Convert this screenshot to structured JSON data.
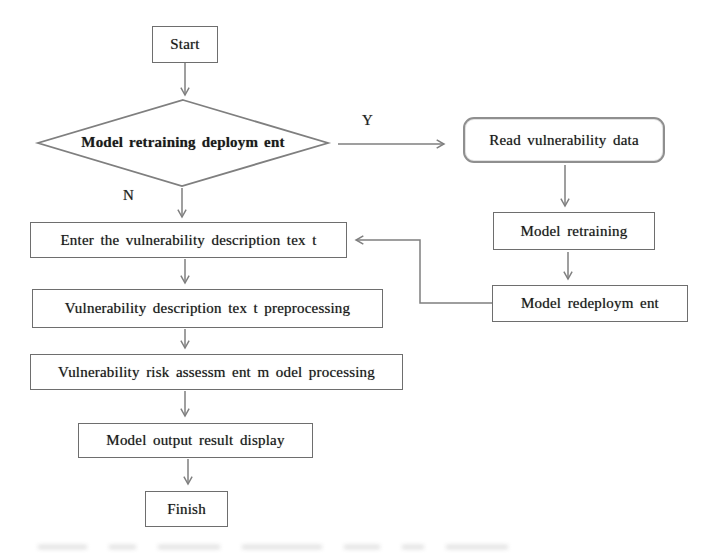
{
  "diagram": {
    "type": "flowchart",
    "background": "#ffffff",
    "colors": {
      "line": "#7f7f7f",
      "box_border": "#6e6e6e",
      "rounded_box_border": "#8f8f8f",
      "text": "#1a1a1a"
    },
    "nodes": {
      "start": {
        "label": "Start",
        "shape": "rectangle"
      },
      "decision": {
        "label": "Model retraining deploym ent",
        "shape": "diamond"
      },
      "read_data": {
        "label": "Read vulnerability data",
        "shape": "rounded-rectangle"
      },
      "model_retraining": {
        "label": "Model retraining",
        "shape": "rectangle"
      },
      "model_redeployment": {
        "label": "Model redeploym ent",
        "shape": "rectangle"
      },
      "enter_text": {
        "label": "Enter the vulnerability description tex t",
        "shape": "rectangle"
      },
      "preprocessing": {
        "label": "Vulnerability description tex t preprocessing",
        "shape": "rectangle"
      },
      "risk_assessment": {
        "label": "Vulnerability risk assessm ent m odel processing",
        "shape": "rectangle"
      },
      "output_display": {
        "label": "Model output result display",
        "shape": "rectangle"
      },
      "finish": {
        "label": "Finish",
        "shape": "rectangle"
      }
    },
    "edge_labels": {
      "yes": "Y",
      "no": "N"
    },
    "edges": [
      {
        "from": "start",
        "to": "decision"
      },
      {
        "from": "decision",
        "to": "read_data",
        "label": "Y"
      },
      {
        "from": "decision",
        "to": "enter_text",
        "label": "N"
      },
      {
        "from": "read_data",
        "to": "model_retraining"
      },
      {
        "from": "model_retraining",
        "to": "model_redeployment"
      },
      {
        "from": "model_redeployment",
        "to": "enter_text"
      },
      {
        "from": "enter_text",
        "to": "preprocessing"
      },
      {
        "from": "preprocessing",
        "to": "risk_assessment"
      },
      {
        "from": "risk_assessment",
        "to": "output_display"
      },
      {
        "from": "output_display",
        "to": "finish"
      }
    ]
  }
}
